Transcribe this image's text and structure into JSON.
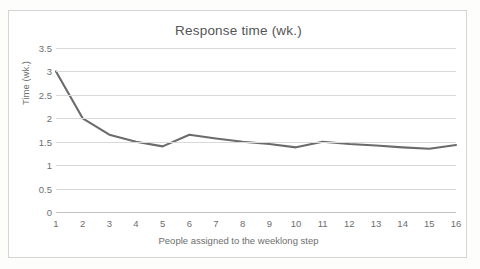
{
  "chart_data": {
    "type": "line",
    "title": "Response time (wk.)",
    "xlabel": "People assigned to the weeklong step",
    "ylabel": "Time (wk.)",
    "x": [
      1,
      2,
      3,
      4,
      5,
      6,
      7,
      8,
      9,
      10,
      11,
      12,
      13,
      14,
      15,
      16
    ],
    "values": [
      3.0,
      2.0,
      1.65,
      1.5,
      1.4,
      1.65,
      1.57,
      1.5,
      1.45,
      1.38,
      1.5,
      1.45,
      1.42,
      1.38,
      1.35,
      1.43
    ],
    "series": [
      {
        "name": "Response time",
        "values": [
          3.0,
          2.0,
          1.65,
          1.5,
          1.4,
          1.65,
          1.57,
          1.5,
          1.45,
          1.38,
          1.5,
          1.45,
          1.42,
          1.38,
          1.35,
          1.43
        ]
      }
    ],
    "categories": [
      "1",
      "2",
      "3",
      "4",
      "5",
      "6",
      "7",
      "8",
      "9",
      "10",
      "11",
      "12",
      "13",
      "14",
      "15",
      "16"
    ],
    "xtick_labels": [
      "1",
      "2",
      "3",
      "4",
      "5",
      "6",
      "7",
      "8",
      "9",
      "10",
      "11",
      "12",
      "13",
      "14",
      "15",
      "16"
    ],
    "ytick_labels": [
      "3.5",
      "3",
      "2.5",
      "2",
      "1.5",
      "1",
      "0.5",
      "0"
    ],
    "ytick_values": [
      3.5,
      3,
      2.5,
      2,
      1.5,
      1,
      0.5,
      0
    ],
    "ylim": [
      0,
      3.5
    ],
    "xlim": [
      1,
      16
    ],
    "grid": "horizontal",
    "legend": "none",
    "line_color": "#6b6b6b",
    "line_width": 2.1,
    "grid_color": "#d9d9d9",
    "text_color": "#6e6e6e",
    "title_color": "#555555",
    "plot_background": "#ffffff"
  }
}
